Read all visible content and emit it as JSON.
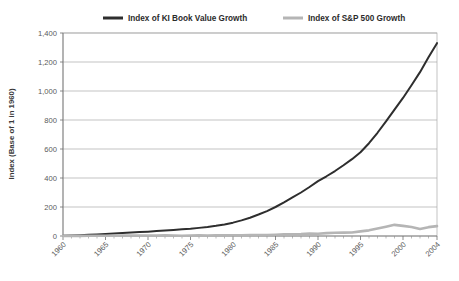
{
  "chart_data": {
    "type": "line",
    "title": "",
    "xlabel": "",
    "ylabel": "Index (Base of 1 in 1960)",
    "ylim": [
      0,
      1400
    ],
    "ytick_values": [
      0,
      200,
      400,
      600,
      800,
      1000,
      1200,
      1400
    ],
    "ytick_labels": [
      "0",
      "200",
      "400",
      "600",
      "800",
      "1,000",
      "1,200",
      "1,400"
    ],
    "xlim": [
      1960,
      2004
    ],
    "xtick_labels": [
      "1960",
      "1965",
      "1970",
      "1975",
      "1980",
      "1985",
      "1990",
      "1995",
      "2000",
      "2004"
    ],
    "xtick_values": [
      1960,
      1965,
      1970,
      1975,
      1980,
      1985,
      1990,
      1995,
      2000,
      2004
    ],
    "xtick_minor_step": 1,
    "grid": "horizontal",
    "legend_position": "top",
    "x": [
      1960,
      1961,
      1962,
      1963,
      1964,
      1965,
      1966,
      1967,
      1968,
      1969,
      1970,
      1971,
      1972,
      1973,
      1974,
      1975,
      1976,
      1977,
      1978,
      1979,
      1980,
      1981,
      1982,
      1983,
      1984,
      1985,
      1986,
      1987,
      1988,
      1989,
      1990,
      1991,
      1992,
      1993,
      1994,
      1995,
      1996,
      1997,
      1998,
      1999,
      2000,
      2001,
      2002,
      2003,
      2004
    ],
    "series": [
      {
        "name": "Index of KI Book Value Growth",
        "color": "#2e2e2e",
        "width": 2.0,
        "values": [
          1,
          3,
          5,
          8,
          11,
          14,
          17,
          20,
          24,
          27,
          30,
          34,
          38,
          42,
          46,
          50,
          56,
          62,
          70,
          80,
          92,
          108,
          126,
          148,
          172,
          200,
          232,
          266,
          300,
          338,
          378,
          412,
          448,
          488,
          530,
          578,
          640,
          712,
          790,
          872,
          952,
          1040,
          1130,
          1232,
          1330
        ]
      },
      {
        "name": "Index of S&P 500 Growth",
        "color": "#b5b5b5",
        "width": 2.6,
        "values": [
          1,
          1,
          1,
          2,
          2,
          2,
          2,
          3,
          3,
          3,
          3,
          3,
          4,
          3,
          2,
          3,
          4,
          3,
          4,
          4,
          5,
          5,
          6,
          7,
          7,
          9,
          11,
          11,
          13,
          17,
          16,
          20,
          22,
          23,
          24,
          32,
          39,
          51,
          64,
          77,
          70,
          62,
          48,
          61,
          68
        ]
      }
    ],
    "legend": [
      {
        "label": "Index of KI Book Value Growth",
        "color": "#2e2e2e"
      },
      {
        "label": "Index of S&P 500 Growth",
        "color": "#b5b5b5"
      }
    ]
  },
  "geometry": {
    "plot_left": 63,
    "plot_right": 437,
    "plot_top": 33,
    "plot_bottom": 236,
    "legend_y": 18,
    "legend_marker1_x": 103,
    "legend_text1_x": 128,
    "legend_marker2_x": 283,
    "legend_text2_x": 308
  }
}
